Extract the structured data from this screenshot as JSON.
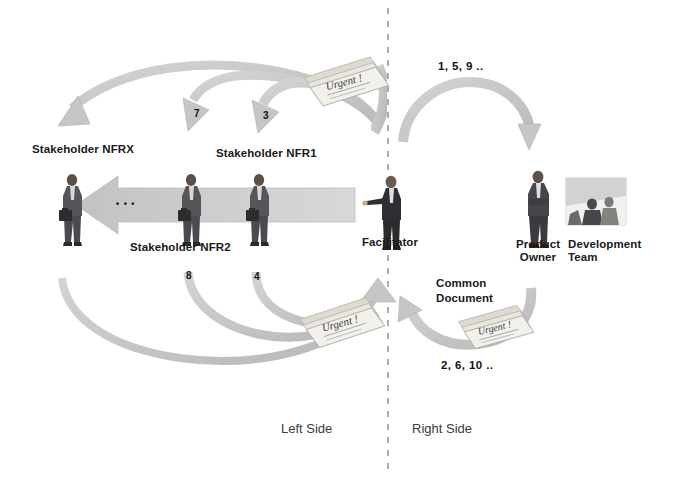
{
  "diagram": {
    "colors": {
      "arrow_fill": "#c9c9c9",
      "arrow_fill_light": "#d6d6d6",
      "arrow_stroke": "#b4b4b4",
      "divider": "#9a9a9a",
      "text": "#1a1a1a",
      "side_text": "#3a3a3a",
      "figure_dark": "#3b3b3b",
      "figure_mid": "#6e6e6e",
      "paper": "#e8e8e6"
    },
    "divider": {
      "name": "left-right-divider",
      "style": "dashed-vertical"
    },
    "actors": [
      {
        "id": "stakeholder-nfrx",
        "label": "Stakeholder NFRX",
        "side": "left"
      },
      {
        "id": "stakeholder-nfr2",
        "label": "Stakeholder NFR2",
        "side": "left"
      },
      {
        "id": "stakeholder-nfr1",
        "label": "Stakeholder NFR1",
        "side": "left"
      },
      {
        "id": "facilitator",
        "label": "Facilitator",
        "side": "center"
      },
      {
        "id": "product-owner",
        "label": "Product\nOwner",
        "label_line1": "Product",
        "label_line2": "Owner",
        "side": "right"
      },
      {
        "id": "development-team",
        "label": "Development\nTeam",
        "label_line1": "Development",
        "label_line2": "Team",
        "side": "right"
      }
    ],
    "ellipsis": "• • •",
    "documents": [
      {
        "id": "common-document-top",
        "caption": "",
        "scribble": "Urgent !"
      },
      {
        "id": "common-document-bottom-left",
        "caption": "",
        "scribble": "Urgent !"
      },
      {
        "id": "common-document-right",
        "caption_line1": "Common",
        "caption_line2": "Document",
        "scribble": "Urgent !"
      }
    ],
    "common_document_label": {
      "line1": "Common",
      "line2": "Document"
    },
    "flow_numbers": {
      "right_top": "1, 5, 9 ..",
      "right_bottom": "2, 6, 10 ..",
      "left_arc_upper_mid": "7",
      "left_arc_upper_inner": "3",
      "left_arc_lower_mid": "8",
      "left_arc_lower_inner": "4"
    },
    "side_labels": {
      "left": "Left Side",
      "right": "Right Side"
    }
  }
}
